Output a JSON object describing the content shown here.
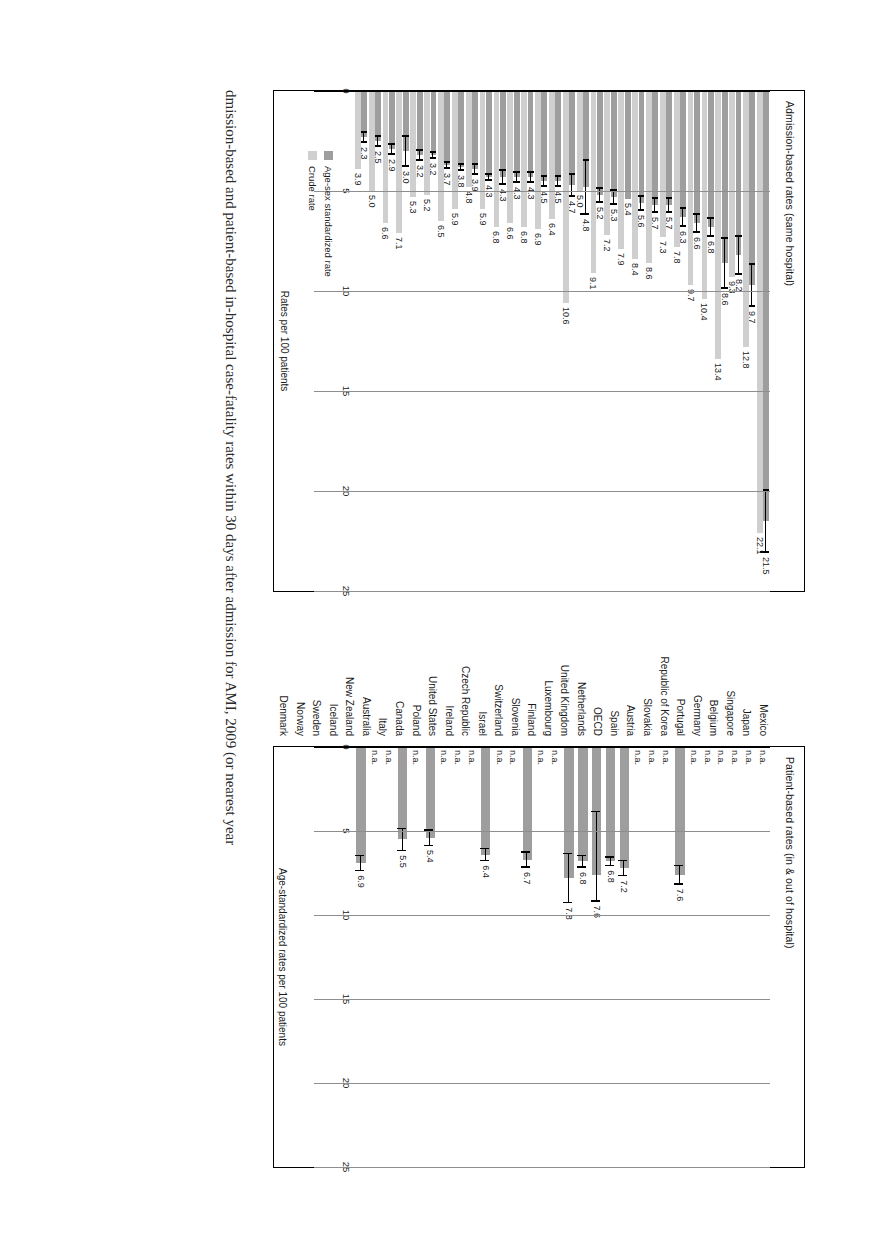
{
  "figure": {
    "caption": "dmission-based and patient-based in-hospital case-fatality rates within 30 days after admission for AMI, 2009 (or nearest year"
  },
  "panels": {
    "left": {
      "title": "Admission-based rates (same hospital)",
      "axis_label": "Rates per 100 patients",
      "ticks": [
        "0",
        "5",
        "10",
        "15",
        "20",
        "25"
      ],
      "xlim": [
        0,
        25
      ],
      "legend": [
        {
          "label": "Age-sex standardized rate",
          "color": "#9e9e9e"
        },
        {
          "label": "Crude rate",
          "color": "#cfcfcf"
        }
      ]
    },
    "right": {
      "title": "Patient-based rates (in & out of hospital)",
      "axis_label": "Age-standardized rates per 100 patients",
      "ticks": [
        "0",
        "5",
        "10",
        "15",
        "20",
        "25"
      ],
      "xlim": [
        0,
        25
      ],
      "not_available_text": "n.a."
    }
  },
  "chart_data": {
    "type": "bar",
    "orientation": "horizontal",
    "categories": [
      "Mexico",
      "Japan",
      "Singapore",
      "Belgium",
      "Germany",
      "Portugal",
      "Republic of Korea",
      "Slovakia",
      "Austria",
      "Spain",
      "OECD",
      "Netherlands",
      "United Kingdom",
      "Luxembourg",
      "Finland",
      "Slovenia",
      "Switzerland",
      "Israel",
      "Czech Republic",
      "Ireland",
      "United States",
      "Poland",
      "Canada",
      "Italy",
      "Australia",
      "New Zealand",
      "Iceland",
      "Sweden",
      "Norway",
      "Denmark"
    ],
    "panels": [
      {
        "name": "Admission-based rates (same hospital)",
        "xlabel": "Rates per 100 patients",
        "xlim": [
          0,
          25
        ],
        "grid": true,
        "series": [
          {
            "name": "Age-sex standardized rate",
            "color": "#9e9e9e",
            "values": [
              21.5,
              9.7,
              8.2,
              8.6,
              6.8,
              6.6,
              6.3,
              5.7,
              5.7,
              5.6,
              5.4,
              5.3,
              5.2,
              4.8,
              4.7,
              4.5,
              4.5,
              4.3,
              4.3,
              4.3,
              4.3,
              3.9,
              3.8,
              3.7,
              3.2,
              3.2,
              3.0,
              2.9,
              2.5,
              2.3
            ],
            "errors_low": [
              19.9,
              8.6,
              7.2,
              7.3,
              6.3,
              6.1,
              5.8,
              5.3,
              5.3,
              5.2,
              null,
              4.9,
              4.8,
              3.4,
              4.1,
              4.2,
              4.2,
              4.0,
              4.0,
              3.9,
              4.1,
              3.6,
              3.6,
              3.5,
              3.0,
              2.9,
              2.2,
              2.6,
              2.2,
              2.0
            ],
            "errors_high": [
              23.1,
              10.8,
              9.2,
              9.9,
              7.3,
              7.1,
              6.8,
              6.1,
              6.1,
              6.0,
              null,
              5.7,
              5.6,
              6.2,
              5.3,
              4.8,
              4.8,
              4.6,
              4.6,
              4.7,
              4.5,
              4.2,
              4.0,
              3.9,
              3.4,
              3.5,
              3.8,
              3.2,
              2.8,
              2.6
            ]
          },
          {
            "name": "Crude rate",
            "color": "#cfcfcf",
            "values": [
              22.1,
              12.8,
              9.3,
              13.4,
              10.4,
              9.7,
              7.8,
              7.3,
              8.6,
              8.4,
              7.9,
              7.2,
              9.1,
              5.0,
              10.6,
              6.4,
              6.9,
              6.8,
              6.6,
              6.8,
              5.9,
              4.8,
              5.9,
              6.5,
              5.2,
              5.3,
              7.1,
              6.6,
              5.0,
              3.9
            ]
          }
        ]
      },
      {
        "name": "Patient-based rates (in & out of hospital)",
        "xlabel": "Age-standardized rates per 100 patients",
        "xlim": [
          0,
          25
        ],
        "grid": true,
        "series": [
          {
            "name": "Age-standardized rate",
            "color": "#9e9e9e",
            "values": [
              null,
              null,
              null,
              null,
              null,
              null,
              7.6,
              null,
              null,
              null,
              7.2,
              6.8,
              7.6,
              6.8,
              7.8,
              null,
              null,
              6.7,
              null,
              null,
              6.4,
              null,
              null,
              null,
              5.4,
              null,
              5.5,
              null,
              null,
              6.9
            ],
            "errors_low": [
              null,
              null,
              null,
              null,
              null,
              null,
              7.0,
              null,
              null,
              null,
              6.7,
              6.5,
              3.8,
              6.4,
              6.3,
              null,
              null,
              6.2,
              null,
              null,
              6.0,
              null,
              null,
              null,
              4.9,
              null,
              4.8,
              null,
              null,
              6.4
            ],
            "errors_high": [
              null,
              null,
              null,
              null,
              null,
              null,
              8.2,
              null,
              null,
              null,
              7.7,
              7.1,
              9.2,
              7.2,
              9.3,
              null,
              null,
              7.2,
              null,
              null,
              6.8,
              null,
              null,
              null,
              5.9,
              null,
              6.2,
              null,
              null,
              7.4
            ]
          }
        ],
        "not_available_label": "n.a.",
        "not_available_categories": [
          "Mexico",
          "Japan",
          "Singapore",
          "Belgium",
          "Germany",
          "Portugal",
          "Slovakia",
          "Austria",
          "Spain",
          "Switzerland",
          "Israel",
          "Czech Republic",
          "Ireland",
          "Canada",
          "Italy",
          "Australia",
          "Iceland",
          "Norway"
        ]
      }
    ]
  }
}
